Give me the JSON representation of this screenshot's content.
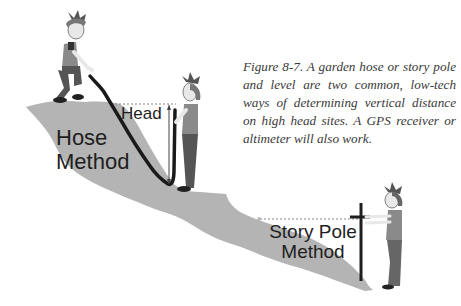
{
  "figure": {
    "caption": "Figure 8-7. A garden hose or story pole and level are two common, low-tech ways of determining vertical distance on high head sites. A GPS receiver or altimeter will also work.",
    "labels": {
      "hose_method_line1": "Hose",
      "hose_method_line2": "Method",
      "head": "Head",
      "story_pole_line1": "Story Pole",
      "story_pole_line2": "Method"
    },
    "colors": {
      "terrain": "#b4b4b4",
      "outline": "#1a1a1a",
      "shirt": "#8a8a8a",
      "pants": "#555555",
      "skin": "#e8e8e8",
      "dotted_line": "#888888"
    },
    "elements": [
      "person-crouching-on-hilltop",
      "garden-hose",
      "person-holding-hose-end",
      "head-measurement-arrow",
      "story-pole",
      "person-holding-story-pole"
    ]
  }
}
